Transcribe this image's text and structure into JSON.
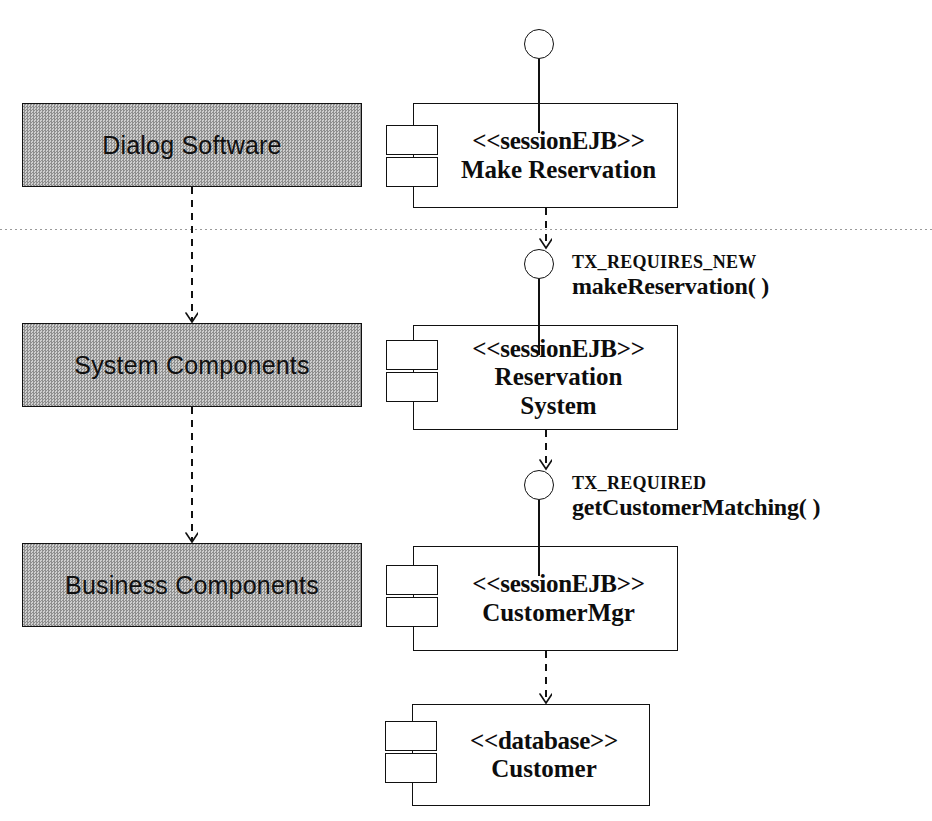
{
  "diagram": {
    "divider": {
      "name": "layer-divider",
      "y": 229
    },
    "colors": {
      "line": "#111111",
      "layer_fill": "#b0b0b0",
      "text": "#0d0d0d"
    }
  },
  "layers": [
    {
      "id": "dialog",
      "label": "Dialog Software",
      "x": 22,
      "y": 103,
      "w": 340,
      "h": 84
    },
    {
      "id": "system",
      "label": "System Components",
      "x": 22,
      "y": 323,
      "w": 340,
      "h": 84
    },
    {
      "id": "business",
      "label": "Business Components",
      "x": 22,
      "y": 543,
      "w": 340,
      "h": 84
    }
  ],
  "components": [
    {
      "id": "make-reservation",
      "stereotype": "<<sessionEJB>>",
      "lines": [
        "Make Reservation"
      ],
      "x": 413,
      "y": 103,
      "w": 265,
      "h": 105
    },
    {
      "id": "reservation-system",
      "stereotype": "<<sessionEJB>>",
      "lines": [
        "Reservation",
        "System"
      ],
      "x": 413,
      "y": 325,
      "w": 265,
      "h": 105
    },
    {
      "id": "customer-mgr",
      "stereotype": "<<sessionEJB>>",
      "lines": [
        "CustomerMgr"
      ],
      "x": 413,
      "y": 546,
      "w": 265,
      "h": 105
    },
    {
      "id": "customer-db",
      "stereotype": "<<database>>",
      "lines": [
        "Customer"
      ],
      "x": 412,
      "y": 704,
      "w": 238,
      "h": 102
    }
  ],
  "interfaces": [
    {
      "id": "top-interface",
      "circle_x": 524,
      "circle_y": 29,
      "stem_height": 74,
      "tx_attribute": "",
      "operation": ""
    },
    {
      "id": "make-reservation-interface",
      "circle_x": 524,
      "circle_y": 249,
      "stem_height": 76,
      "tx_attribute": "TX_REQUIRES_NEW",
      "operation": "makeReservation( )",
      "label_x": 572,
      "label_y": 252
    },
    {
      "id": "get-customer-matching-interface",
      "circle_x": 524,
      "circle_y": 470,
      "stem_height": 76,
      "tx_attribute": "TX_REQUIRED",
      "operation": "getCustomerMatching( )",
      "label_x": 572,
      "label_y": 473
    }
  ],
  "dependencies": [
    {
      "id": "dialog-to-system",
      "from": "dialog",
      "to": "system",
      "x": 192,
      "y1": 187,
      "y2": 323
    },
    {
      "id": "system-to-business",
      "from": "system",
      "to": "business",
      "x": 192,
      "y1": 407,
      "y2": 543
    },
    {
      "id": "make-reservation-to-iface",
      "from": "make-reservation",
      "to": "make-reservation-interface",
      "x": 546,
      "y1": 208,
      "y2": 249
    },
    {
      "id": "reservation-system-to-iface",
      "from": "reservation-system",
      "to": "get-customer-matching-interface",
      "x": 546,
      "y1": 430,
      "y2": 470
    },
    {
      "id": "customer-mgr-to-customer",
      "from": "customer-mgr",
      "to": "customer-db",
      "x": 546,
      "y1": 651,
      "y2": 704
    }
  ]
}
